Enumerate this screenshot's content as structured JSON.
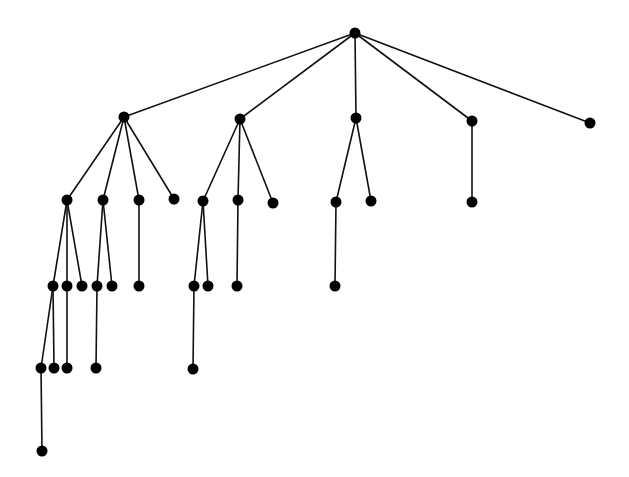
{
  "diagram": {
    "type": "rooted-tree",
    "colors": {
      "edge": "#111111",
      "node": "#000000",
      "background": "#ffffff"
    },
    "node_radius": 5.5,
    "nodes": [
      {
        "id": "n0",
        "x": 355,
        "y": 33
      },
      {
        "id": "n1",
        "x": 124,
        "y": 117
      },
      {
        "id": "n2",
        "x": 240,
        "y": 119
      },
      {
        "id": "n3",
        "x": 356,
        "y": 118
      },
      {
        "id": "n4",
        "x": 472,
        "y": 121
      },
      {
        "id": "n5",
        "x": 590,
        "y": 123
      },
      {
        "id": "n6",
        "x": 67,
        "y": 200
      },
      {
        "id": "n7",
        "x": 103,
        "y": 200
      },
      {
        "id": "n8",
        "x": 139,
        "y": 200
      },
      {
        "id": "n9",
        "x": 174,
        "y": 199
      },
      {
        "id": "n10",
        "x": 203,
        "y": 201
      },
      {
        "id": "n11",
        "x": 238,
        "y": 200
      },
      {
        "id": "n12",
        "x": 273,
        "y": 203
      },
      {
        "id": "n13",
        "x": 336,
        "y": 202
      },
      {
        "id": "n14",
        "x": 371,
        "y": 201
      },
      {
        "id": "n15",
        "x": 472,
        "y": 202
      },
      {
        "id": "n16",
        "x": 53,
        "y": 286
      },
      {
        "id": "n17",
        "x": 67,
        "y": 286
      },
      {
        "id": "n18",
        "x": 82,
        "y": 286
      },
      {
        "id": "n19",
        "x": 97,
        "y": 286
      },
      {
        "id": "n20",
        "x": 112,
        "y": 286
      },
      {
        "id": "n21",
        "x": 139,
        "y": 286
      },
      {
        "id": "n22",
        "x": 194,
        "y": 286
      },
      {
        "id": "n23",
        "x": 208,
        "y": 286
      },
      {
        "id": "n24",
        "x": 237,
        "y": 286
      },
      {
        "id": "n25",
        "x": 335,
        "y": 286
      },
      {
        "id": "n26",
        "x": 41,
        "y": 368
      },
      {
        "id": "n27",
        "x": 54,
        "y": 368
      },
      {
        "id": "n28",
        "x": 67,
        "y": 368
      },
      {
        "id": "n29",
        "x": 96,
        "y": 368
      },
      {
        "id": "n30",
        "x": 193,
        "y": 369
      },
      {
        "id": "n31",
        "x": 42,
        "y": 451
      }
    ],
    "edges": [
      [
        "n0",
        "n1"
      ],
      [
        "n0",
        "n2"
      ],
      [
        "n0",
        "n3"
      ],
      [
        "n0",
        "n4"
      ],
      [
        "n0",
        "n5"
      ],
      [
        "n1",
        "n6"
      ],
      [
        "n1",
        "n7"
      ],
      [
        "n1",
        "n8"
      ],
      [
        "n1",
        "n9"
      ],
      [
        "n2",
        "n10"
      ],
      [
        "n2",
        "n11"
      ],
      [
        "n2",
        "n12"
      ],
      [
        "n3",
        "n13"
      ],
      [
        "n3",
        "n14"
      ],
      [
        "n4",
        "n15"
      ],
      [
        "n6",
        "n16"
      ],
      [
        "n6",
        "n17"
      ],
      [
        "n6",
        "n18"
      ],
      [
        "n7",
        "n19"
      ],
      [
        "n7",
        "n20"
      ],
      [
        "n8",
        "n21"
      ],
      [
        "n10",
        "n22"
      ],
      [
        "n10",
        "n23"
      ],
      [
        "n11",
        "n24"
      ],
      [
        "n13",
        "n25"
      ],
      [
        "n16",
        "n26"
      ],
      [
        "n16",
        "n27"
      ],
      [
        "n17",
        "n28"
      ],
      [
        "n19",
        "n29"
      ],
      [
        "n22",
        "n30"
      ],
      [
        "n26",
        "n31"
      ]
    ]
  }
}
